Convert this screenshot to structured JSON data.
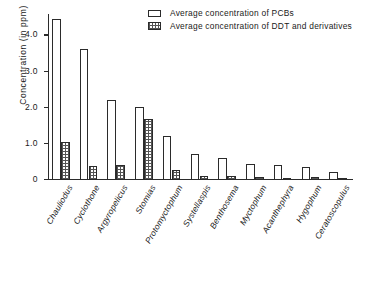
{
  "chart_data": {
    "type": "bar",
    "title": "",
    "xlabel": "",
    "ylabel": "Concentration (in ppm)",
    "ylim": [
      0,
      4.6
    ],
    "yticks": [
      0,
      1.0,
      2.0,
      3.0,
      4.0
    ],
    "yticklabels": [
      "0",
      "1.0",
      "2.0",
      "3.0",
      "4.0"
    ],
    "grid": false,
    "legend_position": "top-right",
    "categories": [
      "Chauliodus",
      "Cyclothone",
      "Argyropelicus",
      "Stomias",
      "Protomyctophum",
      "Systellaspis",
      "Benthosema",
      "Myctophum",
      "Acanthephyra",
      "Hygophum",
      "Ceratoscopulus"
    ],
    "series": [
      {
        "name": "Average concentration of PCBs",
        "pattern": "open",
        "values": [
          4.45,
          3.62,
          2.22,
          2.02,
          1.22,
          0.72,
          0.6,
          0.45,
          0.42,
          0.35,
          0.22
        ]
      },
      {
        "name": "Average concentration of DDT and derivatives",
        "pattern": "hatched",
        "values": [
          1.05,
          0.38,
          0.42,
          1.68,
          0.28,
          0.1,
          0.1,
          0.08,
          0.05,
          0.07,
          0.06
        ]
      }
    ]
  },
  "legend": {
    "items": [
      {
        "label": "Average concentration of PCBs",
        "swatch": "open-rect-swatch"
      },
      {
        "label": "Average concentration of DDT and derivatives",
        "swatch": "hatched-rect-swatch"
      }
    ]
  },
  "axis": {
    "y_title": "Concentration (in ppm)"
  }
}
